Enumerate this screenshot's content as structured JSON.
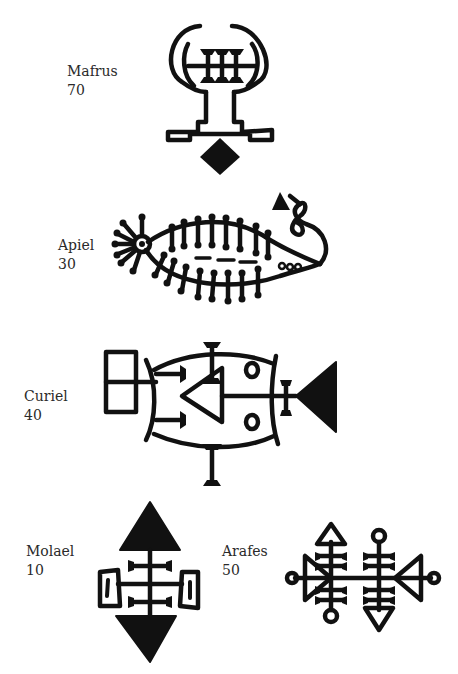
{
  "sigils": [
    {
      "name": "Mafrus",
      "number": "70"
    },
    {
      "name": "Apiel",
      "number": "30"
    },
    {
      "name": "Curiel",
      "number": "40"
    },
    {
      "name": "Molael",
      "number": "10"
    },
    {
      "name": "Arafes",
      "number": "50"
    }
  ],
  "colors": {
    "ink": "#111111",
    "text": "#2a2a2a",
    "background": "#ffffff"
  }
}
